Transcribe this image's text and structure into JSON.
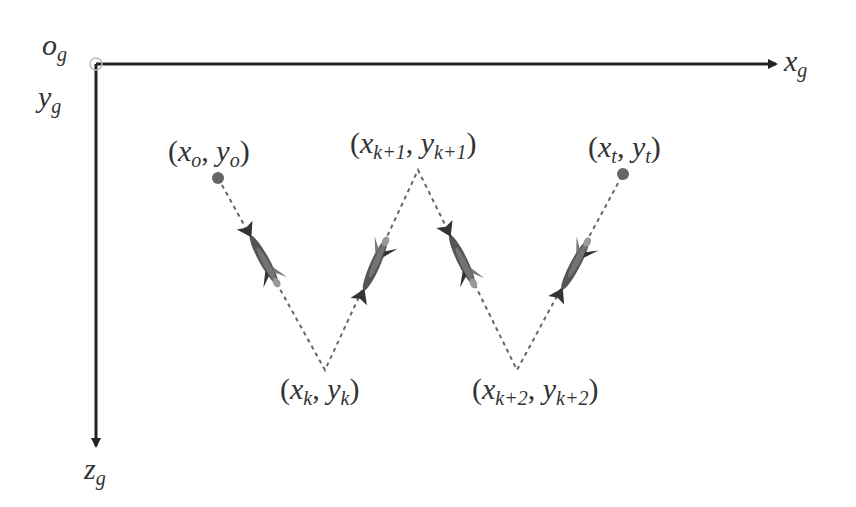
{
  "axes": {
    "origin_label": "o",
    "origin_sub": "g",
    "x_label": "x",
    "x_sub": "g",
    "y_label": "y",
    "y_sub": "g",
    "z_label": "z",
    "z_sub": "g"
  },
  "points": [
    {
      "id": "start",
      "x_sym": "x",
      "x_sub": "o",
      "y_sym": "y",
      "y_sub": "o",
      "has_dot": true
    },
    {
      "id": "k",
      "x_sym": "x",
      "x_sub": "k",
      "y_sym": "y",
      "y_sub": "k",
      "has_dot": false
    },
    {
      "id": "k1",
      "x_sym": "x",
      "x_sub": "k+1",
      "y_sym": "y",
      "y_sub": "k+1",
      "has_dot": false
    },
    {
      "id": "k2",
      "x_sym": "x",
      "x_sub": "k+2",
      "y_sym": "y",
      "y_sub": "k+2",
      "has_dot": false
    },
    {
      "id": "target",
      "x_sym": "x",
      "x_sub": "t",
      "y_sym": "y",
      "y_sub": "t",
      "has_dot": true
    }
  ],
  "punct": {
    "open": "(",
    "comma": ",",
    "close": ")"
  },
  "colors": {
    "axis": "#222222",
    "path": "#555555",
    "dot": "#666666",
    "fish": "#4a4a4a"
  },
  "path": {
    "style": "dashed zigzag",
    "segments": 4
  }
}
